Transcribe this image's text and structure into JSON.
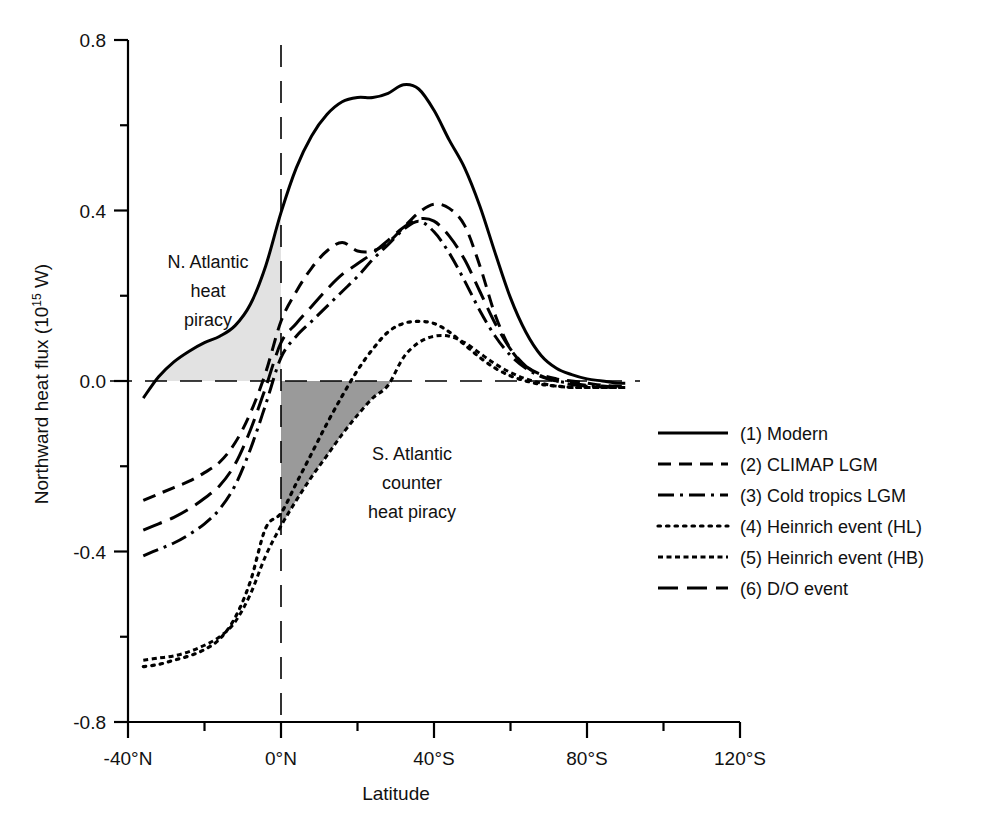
{
  "chart_data": {
    "type": "line",
    "title": "",
    "xlabel": "Latitude",
    "ylabel": "Northward heat flux (10^15 W)",
    "ylabel_main": "Northward heat flux (10",
    "ylabel_sup": "15",
    "ylabel_tail": " W)",
    "xlim": [
      -40,
      120
    ],
    "ylim": [
      -0.8,
      0.8
    ],
    "x_tick_labels": [
      "-40°N",
      "0°N",
      "40°S",
      "80°S",
      "120°S"
    ],
    "x_tick_values": [
      -40,
      0,
      40,
      80,
      120
    ],
    "x_minor_values": [
      -20,
      20,
      60,
      100
    ],
    "y_tick_labels": [
      "0.8",
      "0.4",
      "0.0",
      "-0.4",
      "-0.8"
    ],
    "y_tick_values": [
      0.8,
      0.4,
      0.0,
      -0.4,
      -0.8
    ],
    "y_minor_values": [
      0.6,
      0.2,
      -0.2,
      -0.6
    ],
    "grid": false,
    "zero_line": true,
    "zero_meridian_line": true,
    "legend_position": "right",
    "series": [
      {
        "name": "(1) Modern",
        "style": "solid",
        "x": [
          -36,
          -32,
          -28,
          -24,
          -20,
          -16,
          -12,
          -8,
          -4,
          0,
          4,
          8,
          12,
          16,
          20,
          24,
          28,
          32,
          36,
          40,
          44,
          48,
          52,
          56,
          60,
          64,
          68,
          72,
          76,
          80,
          84,
          88,
          90
        ],
        "y": [
          -0.04,
          0.01,
          0.045,
          0.07,
          0.09,
          0.105,
          0.13,
          0.18,
          0.27,
          0.395,
          0.5,
          0.575,
          0.625,
          0.655,
          0.665,
          0.665,
          0.675,
          0.695,
          0.685,
          0.635,
          0.565,
          0.5,
          0.41,
          0.3,
          0.195,
          0.115,
          0.06,
          0.03,
          0.015,
          0.005,
          0.0,
          -0.005,
          -0.005
        ]
      },
      {
        "name": "(2) CLIMAP LGM",
        "style": "dashed",
        "x": [
          -36,
          -32,
          -28,
          -24,
          -20,
          -16,
          -12,
          -8,
          -4,
          0,
          4,
          8,
          12,
          16,
          20,
          24,
          28,
          32,
          36,
          40,
          44,
          48,
          52,
          56,
          60,
          64,
          68,
          72,
          76,
          80,
          84,
          88,
          90
        ],
        "y": [
          -0.28,
          -0.265,
          -0.25,
          -0.235,
          -0.215,
          -0.19,
          -0.145,
          -0.075,
          0.02,
          0.14,
          0.21,
          0.265,
          0.305,
          0.325,
          0.305,
          0.305,
          0.325,
          0.36,
          0.395,
          0.415,
          0.405,
          0.365,
          0.27,
          0.155,
          0.075,
          0.035,
          0.015,
          0.005,
          0.0,
          -0.005,
          -0.01,
          -0.012,
          -0.012
        ]
      },
      {
        "name": "(3) Cold tropics LGM",
        "style": "dashdot",
        "x": [
          -36,
          -32,
          -28,
          -24,
          -20,
          -16,
          -12,
          -8,
          -4,
          0,
          4,
          8,
          12,
          16,
          20,
          24,
          28,
          32,
          36,
          40,
          44,
          48,
          52,
          56,
          60,
          64,
          68,
          72,
          76,
          80,
          84,
          88,
          90
        ],
        "y": [
          -0.41,
          -0.395,
          -0.38,
          -0.36,
          -0.335,
          -0.3,
          -0.245,
          -0.16,
          -0.055,
          0.055,
          0.105,
          0.14,
          0.175,
          0.21,
          0.245,
          0.285,
          0.32,
          0.355,
          0.375,
          0.35,
          0.3,
          0.235,
          0.165,
          0.105,
          0.06,
          0.03,
          0.01,
          0.0,
          -0.005,
          -0.01,
          -0.012,
          -0.015,
          -0.015
        ]
      },
      {
        "name": "(4) Heinrich event (HL)",
        "style": "dotted",
        "x": [
          -36,
          -32,
          -28,
          -24,
          -20,
          -16,
          -12,
          -8,
          -4,
          0,
          4,
          8,
          12,
          16,
          20,
          24,
          28,
          32,
          36,
          40,
          44,
          48,
          52,
          56,
          60,
          64,
          68,
          72,
          76,
          80,
          84,
          88,
          90
        ],
        "y": [
          -0.67,
          -0.665,
          -0.655,
          -0.645,
          -0.63,
          -0.605,
          -0.555,
          -0.47,
          -0.345,
          -0.31,
          -0.24,
          -0.17,
          -0.1,
          -0.035,
          0.025,
          0.075,
          0.115,
          0.135,
          0.14,
          0.135,
          0.115,
          0.085,
          0.055,
          0.03,
          0.012,
          0.0,
          -0.008,
          -0.012,
          -0.015,
          -0.015,
          -0.015,
          -0.015,
          -0.015
        ]
      },
      {
        "name": "(5) Heinrich event  (HB)",
        "style": "finedash",
        "x": [
          -36,
          -32,
          -28,
          -24,
          -20,
          -16,
          -12,
          -8,
          -4,
          0,
          4,
          8,
          12,
          16,
          20,
          24,
          28,
          32,
          36,
          40,
          44,
          48,
          52,
          56,
          60,
          64,
          68,
          72,
          76,
          80,
          84,
          88,
          90
        ],
        "y": [
          -0.655,
          -0.65,
          -0.645,
          -0.635,
          -0.62,
          -0.6,
          -0.565,
          -0.5,
          -0.41,
          -0.34,
          -0.28,
          -0.225,
          -0.175,
          -0.125,
          -0.08,
          -0.04,
          -0.01,
          0.055,
          0.09,
          0.105,
          0.105,
          0.09,
          0.065,
          0.04,
          0.02,
          0.005,
          -0.005,
          -0.012,
          -0.015,
          -0.015,
          -0.015,
          -0.015,
          -0.015
        ]
      },
      {
        "name": "(6) D/O event",
        "style": "longdash",
        "x": [
          -36,
          -32,
          -28,
          -24,
          -20,
          -16,
          -12,
          -8,
          -4,
          0,
          4,
          8,
          12,
          16,
          20,
          24,
          28,
          32,
          36,
          40,
          44,
          48,
          52,
          56,
          60,
          64,
          68,
          72,
          76,
          80,
          84,
          88,
          90
        ],
        "y": [
          -0.35,
          -0.335,
          -0.32,
          -0.3,
          -0.275,
          -0.245,
          -0.195,
          -0.115,
          -0.015,
          0.09,
          0.135,
          0.175,
          0.215,
          0.25,
          0.275,
          0.3,
          0.33,
          0.36,
          0.38,
          0.375,
          0.34,
          0.285,
          0.21,
          0.135,
          0.075,
          0.035,
          0.012,
          0.0,
          -0.008,
          -0.012,
          -0.014,
          -0.015,
          -0.015
        ]
      }
    ],
    "annotations": [
      {
        "id": "n-atlantic-heat-piracy",
        "lines": [
          "N. Atlantic",
          "heat",
          "piracy"
        ],
        "shade": "#e2e2e2"
      },
      {
        "id": "s-atlantic-counter-heat-piracy",
        "lines": [
          "S. Atlantic",
          "counter",
          "heat piracy"
        ],
        "shade": "#9a9a9a"
      }
    ]
  },
  "legend": {
    "entries": [
      {
        "label": "(1) Modern",
        "style": "solid"
      },
      {
        "label": "(2) CLIMAP LGM",
        "style": "dashed"
      },
      {
        "label": "(3) Cold tropics LGM",
        "style": "dashdot"
      },
      {
        "label": "(4) Heinrich event (HL)",
        "style": "dotted"
      },
      {
        "label": "(5) Heinrich event  (HB)",
        "style": "finedash"
      },
      {
        "label": "(6) D/O event",
        "style": "longdash"
      }
    ]
  },
  "colors": {
    "ink": "#000000",
    "background": "#ffffff",
    "light_shade": "#e2e2e2",
    "dark_shade": "#9a9a9a"
  }
}
